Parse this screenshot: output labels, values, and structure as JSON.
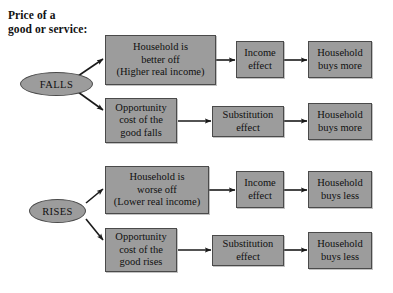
{
  "diagram": {
    "title": "Price of a\ngood or service:",
    "colors": {
      "box_fill": "#9c9c9c",
      "box_border": "#4a4a4a",
      "arrow": "#1a1a1a",
      "background": "#ffffff",
      "text": "#101010"
    },
    "triggers": [
      {
        "label": "FALLS"
      },
      {
        "label": "RISES"
      }
    ],
    "nodes": [
      {
        "id": "falls-better-off",
        "text": "Household is\nbetter off\n(Higher real income)"
      },
      {
        "id": "falls-income-effect",
        "text": "Income\neffect"
      },
      {
        "id": "falls-buys-more-1",
        "text": "Household\nbuys more"
      },
      {
        "id": "falls-opp-cost",
        "text": "Opportunity\ncost of the\ngood falls"
      },
      {
        "id": "falls-subst-effect",
        "text": "Substitution\neffect"
      },
      {
        "id": "falls-buys-more-2",
        "text": "Household\nbuys more"
      },
      {
        "id": "rises-worse-off",
        "text": "Household is\nworse off\n(Lower real income)"
      },
      {
        "id": "rises-income-effect",
        "text": "Income\neffect"
      },
      {
        "id": "rises-buys-less-1",
        "text": "Household\nbuys less"
      },
      {
        "id": "rises-opp-cost",
        "text": "Opportunity\ncost of the\ngood rises"
      },
      {
        "id": "rises-subst-effect",
        "text": "Substitution\neffect"
      },
      {
        "id": "rises-buys-less-2",
        "text": "Household\nbuys less"
      }
    ]
  }
}
